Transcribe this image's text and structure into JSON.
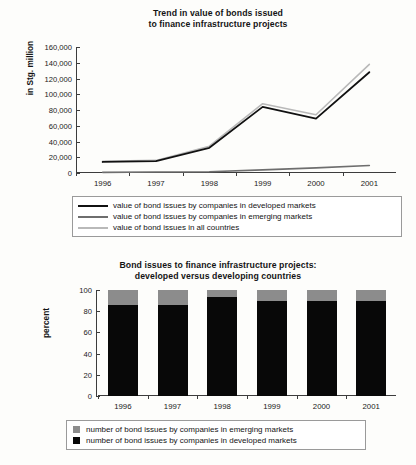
{
  "chart_data": [
    {
      "type": "line",
      "title": "Trend in value of bonds issued to finance infrastructure projects",
      "title_lines": [
        "Trend in value of bonds issued",
        "to finance infrastructure projects"
      ],
      "xlabel": "",
      "ylabel": "in Stg. million",
      "categories": [
        "1996",
        "1997",
        "1998",
        "1999",
        "2000",
        "2001"
      ],
      "ylim": [
        0,
        160000
      ],
      "yticks": [
        "160,000",
        "140,000",
        "120,000",
        "100,000",
        "80,000",
        "60,000",
        "40,000",
        "20,000",
        "0"
      ],
      "ytick_values": [
        160000,
        140000,
        120000,
        100000,
        80000,
        60000,
        40000,
        20000,
        0
      ],
      "grid": false,
      "legend_position": "below",
      "series": [
        {
          "name": "value of bond issues by companies in developed markets",
          "color": "#111111",
          "values": [
            14000,
            15000,
            32000,
            84000,
            69000,
            128000
          ]
        },
        {
          "name": "value of bond issues by companies in emerging markets",
          "color": "#6e6e6e",
          "values": [
            800,
            1200,
            1500,
            4000,
            6500,
            9500
          ]
        },
        {
          "name": "value of bond issues in all countries",
          "color": "#b9b9b9",
          "values": [
            15000,
            16000,
            34000,
            88000,
            74000,
            138000
          ]
        }
      ]
    },
    {
      "type": "bar",
      "stacked": true,
      "title": "Bond issues to finance infrastructure projects: developed versus developing countries",
      "title_lines": [
        "Bond issues to finance infrastructure projects:",
        "developed versus developing countries"
      ],
      "xlabel": "",
      "ylabel": "percent",
      "categories": [
        "1996",
        "1997",
        "1998",
        "1999",
        "2000",
        "2001"
      ],
      "ylim": [
        0,
        100
      ],
      "yticks": [
        "100",
        "80",
        "60",
        "40",
        "20",
        "0"
      ],
      "ytick_values": [
        100,
        80,
        60,
        40,
        20,
        0
      ],
      "grid": false,
      "legend_position": "below",
      "series": [
        {
          "name": "number of bond issues by companies in emerging markets",
          "color": "#8c8c8c",
          "values": [
            14,
            14,
            7,
            10,
            10,
            10
          ]
        },
        {
          "name": "number of bond issues by companies in developed markets",
          "color": "#080808",
          "values": [
            86,
            86,
            93,
            90,
            90,
            90
          ]
        }
      ]
    }
  ]
}
